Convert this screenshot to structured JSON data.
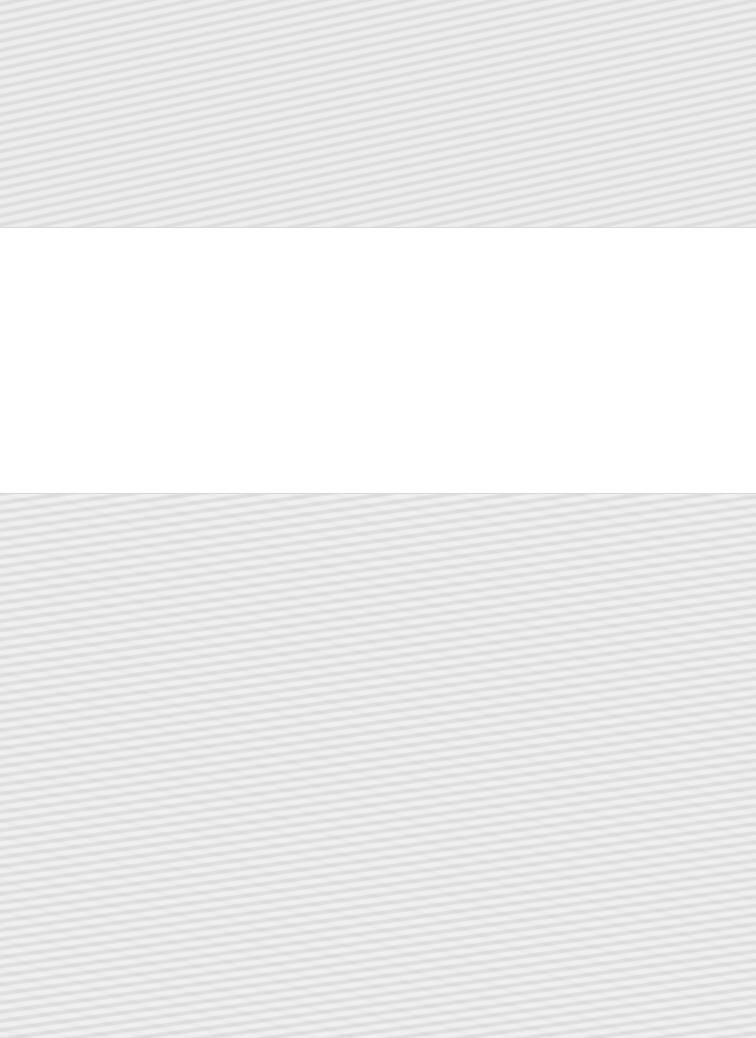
{
  "page": {
    "bands": [
      {
        "name": "top-band",
        "color": "#e4e4e4",
        "texture": "moire"
      },
      {
        "name": "middle-panel",
        "color": "#ffffff",
        "texture": "none"
      },
      {
        "name": "bottom-band",
        "color": "#e4e4e4",
        "texture": "moire"
      }
    ]
  }
}
